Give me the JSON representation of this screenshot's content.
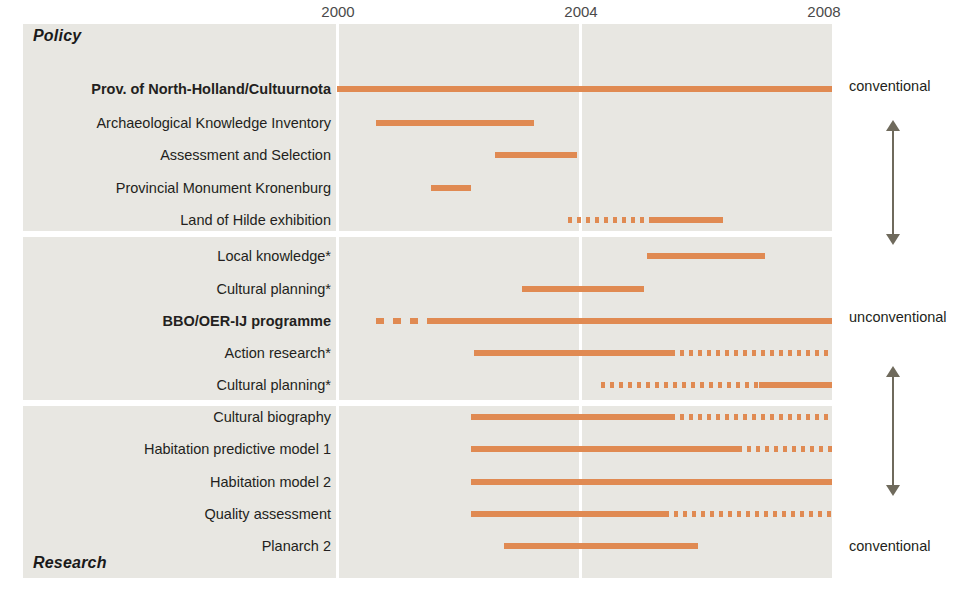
{
  "chart_data": {
    "type": "bar",
    "title": "",
    "subtitle": "",
    "xlabel": "",
    "ylabel": "",
    "xlim": [
      1999.0,
      2008.2
    ],
    "x_ticks": [
      2000,
      2004,
      2008
    ],
    "x_tick_labels": [
      "2000",
      "2004",
      "2008"
    ],
    "grid": "vertical-white-gridlines-at-ticks",
    "legend": "none",
    "bar_color": "#e08a52",
    "panel_color": "#e8e7e2",
    "line_styles": {
      "solid": "continuous activity",
      "dotted": "intermittent / planned activity",
      "dashed": "preparatory activity"
    },
    "section_captions": {
      "top": "Policy",
      "bottom": "Research"
    },
    "groups": [
      {
        "group_name": "Policy",
        "rows": [
          {
            "label": "Prov. of North-Holland/Cultuurnota",
            "bold": true,
            "segments": [
              {
                "start": 2000.0,
                "end": 2003.9,
                "style": "solid"
              },
              {
                "start": 2003.85,
                "end": 2008.15,
                "style": "solid"
              }
            ]
          },
          {
            "label": "Archaeological Knowledge Inventory",
            "bold": false,
            "segments": [
              {
                "start": 2000.65,
                "end": 2003.25,
                "style": "solid"
              }
            ]
          },
          {
            "label": "Assessment and Selection",
            "bold": false,
            "segments": [
              {
                "start": 2002.6,
                "end": 2003.95,
                "style": "solid"
              }
            ]
          },
          {
            "label": "Provincial Monument Kronenburg",
            "bold": false,
            "segments": [
              {
                "start": 2001.55,
                "end": 2002.2,
                "style": "solid"
              }
            ]
          },
          {
            "label": "Land of Hilde exhibition",
            "bold": false,
            "segments": [
              {
                "start": 2003.8,
                "end": 2005.2,
                "style": "dotted"
              },
              {
                "start": 2005.2,
                "end": 2006.35,
                "style": "solid"
              }
            ]
          }
        ]
      },
      {
        "group_name": "Middle",
        "rows": [
          {
            "label": "Local knowledge*",
            "bold": false,
            "segments": [
              {
                "start": 2005.1,
                "end": 2007.05,
                "style": "solid"
              }
            ]
          },
          {
            "label": "Cultural planning*",
            "bold": false,
            "segments": [
              {
                "start": 2003.05,
                "end": 2005.05,
                "style": "solid"
              }
            ]
          },
          {
            "label": "BBO/OER-IJ programme",
            "bold": true,
            "segments": [
              {
                "start": 2000.65,
                "end": 2001.5,
                "style": "dashed"
              },
              {
                "start": 2001.5,
                "end": 2008.15,
                "style": "solid"
              }
            ]
          },
          {
            "label": "Action research*",
            "bold": false,
            "segments": [
              {
                "start": 2002.25,
                "end": 2005.5,
                "style": "solid"
              },
              {
                "start": 2005.5,
                "end": 2008.15,
                "style": "dotted"
              }
            ]
          },
          {
            "label": "Cultural planning*",
            "bold": false,
            "segments": [
              {
                "start": 2004.35,
                "end": 2006.95,
                "style": "dotted"
              },
              {
                "start": 2006.95,
                "end": 2008.15,
                "style": "solid"
              }
            ]
          }
        ]
      },
      {
        "group_name": "Research",
        "rows": [
          {
            "label": "Cultural biography",
            "bold": false,
            "segments": [
              {
                "start": 2002.2,
                "end": 2005.5,
                "style": "solid"
              },
              {
                "start": 2005.5,
                "end": 2008.15,
                "style": "dotted"
              }
            ]
          },
          {
            "label": "Habitation predictive model 1",
            "bold": false,
            "segments": [
              {
                "start": 2002.2,
                "end": 2006.6,
                "style": "solid"
              },
              {
                "start": 2006.6,
                "end": 2008.15,
                "style": "dotted"
              }
            ]
          },
          {
            "label": "Habitation model 2",
            "bold": false,
            "segments": [
              {
                "start": 2002.2,
                "end": 2008.15,
                "style": "solid"
              }
            ]
          },
          {
            "label": "Quality assessment",
            "bold": false,
            "segments": [
              {
                "start": 2002.2,
                "end": 2005.4,
                "style": "solid"
              },
              {
                "start": 2005.4,
                "end": 2008.15,
                "style": "dotted"
              }
            ]
          },
          {
            "label": "Planarch 2",
            "bold": false,
            "segments": [
              {
                "start": 2002.75,
                "end": 2005.95,
                "style": "solid"
              }
            ]
          }
        ]
      }
    ],
    "annotations": [
      {
        "name": "conventional-top",
        "text": "conventional",
        "y": 78
      },
      {
        "name": "unconventional-mid",
        "text": "unconventional",
        "y": 309
      },
      {
        "name": "conventional-bottom",
        "text": "conventional",
        "y": 538
      }
    ],
    "arrows": [
      {
        "name": "conventional-unconventional-arrow-upper",
        "top": 120,
        "height": 125,
        "direction": "both"
      },
      {
        "name": "unconventional-conventional-arrow-lower",
        "top": 366,
        "height": 130,
        "direction": "both"
      }
    ]
  }
}
